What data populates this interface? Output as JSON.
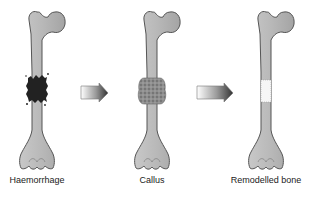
{
  "diagram": {
    "type": "process-flow",
    "stages": [
      {
        "label": "Haemorrhage",
        "fracture_marker": "dark clot",
        "color": "#2a2a2a"
      },
      {
        "label": "Callus",
        "fracture_marker": "granular callus",
        "color": "#8a8a8a"
      },
      {
        "label": "Remodelled bone",
        "fracture_marker": "pale remodelled segment",
        "color": "#f4f4f4"
      }
    ],
    "arrows": [
      {
        "from": "Haemorrhage",
        "to": "Callus"
      },
      {
        "from": "Callus",
        "to": "Remodelled bone"
      }
    ],
    "colors": {
      "bone_fill": "#bcbcbc",
      "bone_stroke": "#555555",
      "arrow_dark": "#333333",
      "arrow_light": "#ffffff"
    }
  }
}
